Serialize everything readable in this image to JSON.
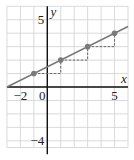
{
  "chart_data": {
    "type": "line",
    "title": "",
    "xlabel": "x",
    "ylabel": "y",
    "xlim": [
      -3,
      6
    ],
    "ylim": [
      -5,
      6
    ],
    "grid": true,
    "x_tick_labels": [
      {
        "value": -2,
        "label": "−2"
      },
      {
        "value": 0,
        "label": "0"
      },
      {
        "value": 5,
        "label": "5"
      }
    ],
    "y_tick_labels": [
      {
        "value": 5,
        "label": "5"
      },
      {
        "value": -4,
        "label": "−4"
      }
    ],
    "series": [
      {
        "name": "line",
        "equation": "y = 0.5x + 1.5",
        "x": [
          -3,
          6
        ],
        "y": [
          0,
          4.5
        ],
        "color": "#777777"
      },
      {
        "name": "points",
        "x": [
          -1,
          1,
          3,
          5
        ],
        "y": [
          1,
          2,
          3,
          4
        ],
        "color": "#777777"
      }
    ],
    "step_triangles": [
      {
        "from": [
          -1,
          1
        ],
        "corner": [
          1,
          1
        ],
        "to": [
          1,
          2
        ]
      },
      {
        "from": [
          1,
          2
        ],
        "corner": [
          3,
          2
        ],
        "to": [
          3,
          3
        ]
      },
      {
        "from": [
          3,
          3
        ],
        "corner": [
          5,
          3
        ],
        "to": [
          5,
          4
        ]
      }
    ]
  },
  "colors": {
    "grid": "#d9d9d9",
    "axis": "#111111",
    "line": "#7a7a7a",
    "point": "#7a7a7a",
    "dashed": "#666666"
  }
}
